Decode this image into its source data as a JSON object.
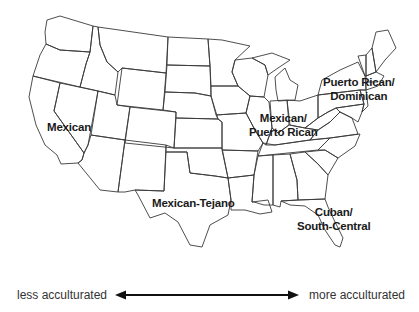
{
  "map": {
    "title": "United States regional Hispanic subgroups",
    "regions": [
      {
        "id": "west",
        "label": "Mexican"
      },
      {
        "id": "texas",
        "label": "Mexican-Tejano"
      },
      {
        "id": "midwest",
        "line1": "Mexican/",
        "line2": "Puerto Rican"
      },
      {
        "id": "northeast",
        "line1": "Puerto Rican/",
        "line2": "Dominican"
      },
      {
        "id": "southeast",
        "line1": "Cuban/",
        "line2": "South-Central"
      }
    ]
  },
  "scale": {
    "left_label": "less acculturated",
    "right_label": "more acculturated",
    "direction": "bidirectional-arrow"
  },
  "colors": {
    "background": "#ffffff",
    "lines": "#3a3a3a",
    "text": "#1a1a1a"
  }
}
